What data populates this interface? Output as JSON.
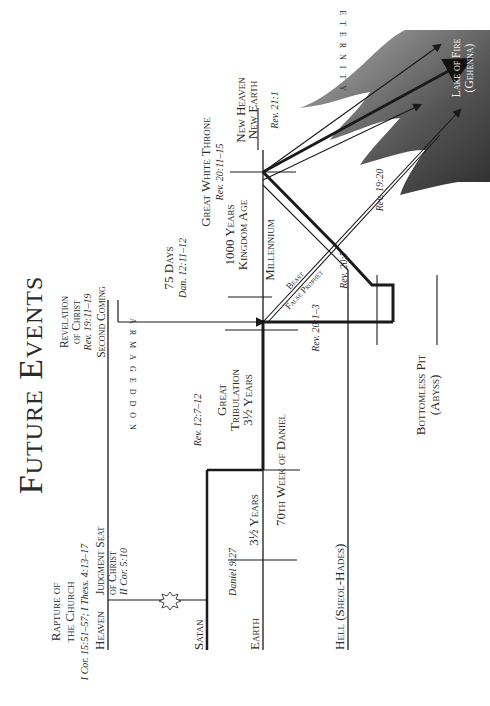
{
  "title": "Future Events",
  "realms": {
    "heaven": "Heaven",
    "satan": "Satan",
    "earth": "Earth",
    "hell": "Hell (Sheol-Hades)"
  },
  "events": {
    "rapture": {
      "line1": "Rapture of",
      "line2": "the Church",
      "ref": "I Cor. 15:51–57; I Thess. 4:13–17"
    },
    "judgment_seat": {
      "line1": "Judgment Seat",
      "line2": "of Christ",
      "ref": "II Cor. 5:10"
    },
    "revelation": {
      "line1": "Revelation",
      "line2": "of Christ",
      "ref": "Rev. 19:11–19",
      "line3": "Second Coming"
    },
    "armageddon": "ARMAGEDDON",
    "days75": {
      "label": "75 Days",
      "ref": "Dan. 12:11–12"
    },
    "great_white_throne": {
      "label": "Great White Throne",
      "ref": "Rev. 20:11–15"
    },
    "new_heaven": {
      "line1": "New Heaven",
      "line2": "New Earth",
      "ref": "Rev. 21:1"
    },
    "eternity": "ETERNITY",
    "lake_of_fire": {
      "line1": "Lake of Fire",
      "line2": "(Gehenna)"
    },
    "kingdom": {
      "line1": "1000 Years",
      "line2": "Kingdom Age"
    },
    "millennium": "Millennium",
    "beast": "Beast",
    "false_prophet": "False Prophet",
    "great_tribulation": {
      "line1": "Great",
      "line2": "Tribulation",
      "line3": "3½ Years"
    },
    "first_half": "3½ Years",
    "seventieth_week": "70th Week of Daniel",
    "bottomless_pit": {
      "line1": "Bottomless Pit",
      "line2": "(Abyss)"
    }
  },
  "references": {
    "daniel_927": "Daniel 9:27",
    "rev_127": "Rev. 12:7–12",
    "rev_2013": "Rev. 20:1–3",
    "rev_207": "Rev. 20:7",
    "rev_1920": "Rev. 19:20"
  },
  "colors": {
    "line": "#1a1a1a",
    "text": "#2a2a2a",
    "fire_dark": "#3a3a3a",
    "fire_light": "#9a9a9a"
  }
}
